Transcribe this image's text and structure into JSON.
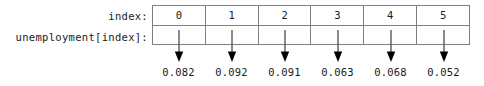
{
  "figure": {
    "row_labels": [
      {
        "text": "index:"
      },
      {
        "text": "unemployment[index]:"
      }
    ],
    "table": {
      "header_cells": [
        "0",
        "1",
        "2",
        "3",
        "4",
        "5"
      ],
      "body_cells": [
        "",
        "",
        "",
        "",
        "",
        ""
      ]
    },
    "arrow_count": 6,
    "values": [
      "0.082",
      "0.092",
      "0.091",
      "0.063",
      "0.068",
      "0.052"
    ],
    "colors": {
      "background": "#ffffff",
      "text": "#1a1a1a",
      "border": "#808080",
      "arrow_shaft": "#595959",
      "arrow_head": "#000000"
    }
  }
}
